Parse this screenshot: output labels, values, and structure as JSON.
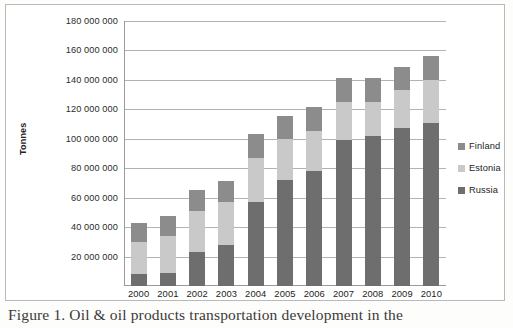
{
  "figure": {
    "caption": "Figure 1. Oil & oil products transportation development in the"
  },
  "legend": {
    "position": "right",
    "items": [
      {
        "label": "Finland",
        "color": "#8c8c8c",
        "icon": "legend-swatch-icon"
      },
      {
        "label": "Estonia",
        "color": "#c9c9c9",
        "icon": "legend-swatch-icon"
      },
      {
        "label": "Russia",
        "color": "#6e6e6e",
        "icon": "legend-swatch-icon"
      }
    ]
  },
  "axes": {
    "y_title": "Tonnes",
    "y_ticks": [
      "20 000 000",
      "40 000 000",
      "60 000 000",
      "80 000 000",
      "100 000 000",
      "120 000 000",
      "140 000 000",
      "160 000 000",
      "180 000 000"
    ],
    "x_ticks": [
      "2000",
      "2001",
      "2002",
      "2003",
      "2004",
      "2005",
      "2006",
      "2007",
      "2008",
      "2009",
      "2010"
    ]
  },
  "chart_data": {
    "type": "bar",
    "stacked": true,
    "title": "",
    "xlabel": "",
    "ylabel": "Tonnes",
    "ylim": [
      0,
      180000000
    ],
    "ytick_step": 20000000,
    "grid": true,
    "legend_position": "right",
    "categories": [
      "2000",
      "2001",
      "2002",
      "2003",
      "2004",
      "2005",
      "2006",
      "2007",
      "2008",
      "2009",
      "2010"
    ],
    "series": [
      {
        "name": "Russia",
        "color": "#6e6e6e",
        "values": [
          8000000,
          9000000,
          23000000,
          28000000,
          57000000,
          72000000,
          78000000,
          99000000,
          102000000,
          107000000,
          111000000
        ]
      },
      {
        "name": "Estonia",
        "color": "#c9c9c9",
        "values": [
          22000000,
          25000000,
          28000000,
          29000000,
          30000000,
          28000000,
          27000000,
          26000000,
          23000000,
          26000000,
          29000000
        ]
      },
      {
        "name": "Finland",
        "color": "#8c8c8c",
        "values": [
          12500000,
          13500000,
          14000000,
          14000000,
          16000000,
          15500000,
          16500000,
          16000000,
          16000000,
          16000000,
          16500000
        ]
      }
    ],
    "totals": [
      42500000,
      47500000,
      65000000,
      71000000,
      103000000,
      115500000,
      121500000,
      141000000,
      141000000,
      149000000,
      156500000
    ]
  }
}
